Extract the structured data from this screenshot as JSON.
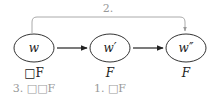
{
  "diagram": {
    "nodes": [
      {
        "id": "w",
        "label": "w",
        "property": "□F",
        "step": "3. □□F"
      },
      {
        "id": "w1",
        "label": "w′",
        "property": "F",
        "step": "1. □F"
      },
      {
        "id": "w2",
        "label": "w″",
        "property": "F",
        "step": ""
      }
    ],
    "edges": [
      {
        "from": "w",
        "to": "w1",
        "style": "solid"
      },
      {
        "from": "w1",
        "to": "w2",
        "style": "solid"
      },
      {
        "from": "w",
        "to": "w2",
        "style": "gray-curved",
        "label": "2."
      }
    ],
    "colors": {
      "node_stroke": "#333333",
      "edge": "#222222",
      "annotation": "#999999",
      "curved_edge": "#aaaaaa"
    }
  }
}
